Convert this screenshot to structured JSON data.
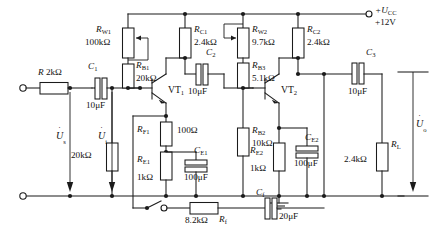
{
  "supply": {
    "label": "+U",
    "sub": "CC",
    "voltage": "+12V"
  },
  "sources": {
    "us_symbol": "U",
    "us_sub": "s",
    "ui_symbol": "U",
    "ui_sub": "i",
    "uo_symbol": "U",
    "uo_sub": "o"
  },
  "transistors": [
    {
      "name": "VT",
      "sub": "1",
      "type": "npn"
    },
    {
      "name": "VT",
      "sub": "2",
      "type": "npn"
    }
  ],
  "components": [
    {
      "id": "R",
      "ref": "R",
      "sub": "",
      "value": "2kΩ",
      "kind": "resistor"
    },
    {
      "id": "RW1",
      "ref": "R",
      "sub": "W1",
      "value": "100kΩ",
      "kind": "potentiometer"
    },
    {
      "id": "RB1",
      "ref": "R",
      "sub": "B1",
      "value": "20kΩ",
      "kind": "resistor"
    },
    {
      "id": "RC1",
      "ref": "R",
      "sub": "C1",
      "value": "2.4kΩ",
      "kind": "resistor"
    },
    {
      "id": "RW2",
      "ref": "R",
      "sub": "W2",
      "value": "9.7kΩ",
      "kind": "potentiometer"
    },
    {
      "id": "RB3",
      "ref": "R",
      "sub": "B3",
      "value": "5.1kΩ",
      "kind": "resistor"
    },
    {
      "id": "RC2",
      "ref": "R",
      "sub": "C2",
      "value": "2.4kΩ",
      "kind": "resistor"
    },
    {
      "id": "RF1",
      "ref": "R",
      "sub": "F1",
      "value": "100Ω",
      "kind": "resistor"
    },
    {
      "id": "RE1",
      "ref": "R",
      "sub": "E1",
      "value": "1kΩ",
      "kind": "resistor"
    },
    {
      "id": "RB2",
      "ref": "R",
      "sub": "B2",
      "value": "10kΩ",
      "kind": "resistor"
    },
    {
      "id": "RE2",
      "ref": "R",
      "sub": "E2",
      "value": "1kΩ",
      "kind": "resistor"
    },
    {
      "id": "RL",
      "ref": "R",
      "sub": "L",
      "value": "2.4kΩ",
      "kind": "resistor"
    },
    {
      "id": "Rf",
      "ref": "R",
      "sub": "f",
      "value": "8.2kΩ",
      "kind": "resistor"
    },
    {
      "id": "C1",
      "ref": "C",
      "sub": "1",
      "value": "10μF",
      "kind": "capacitor"
    },
    {
      "id": "C2",
      "ref": "C",
      "sub": "2",
      "value": "10μF",
      "kind": "capacitor"
    },
    {
      "id": "C3",
      "ref": "C",
      "sub": "3",
      "value": "10μF",
      "kind": "capacitor"
    },
    {
      "id": "CE1",
      "ref": "C",
      "sub": "E1",
      "value": "100μF",
      "kind": "capacitor"
    },
    {
      "id": "CE2",
      "ref": "C",
      "sub": "E2",
      "value": "100μF",
      "kind": "capacitor"
    },
    {
      "id": "Cf",
      "ref": "C",
      "sub": "f",
      "value": "20μF",
      "kind": "capacitor"
    }
  ],
  "labels": {
    "R_ref": "R",
    "R_val": "2kΩ",
    "RW1_ref": "R",
    "RW1_sub": "W1",
    "RW1_val": "100kΩ",
    "RB1_ref": "R",
    "RB1_sub": "B1",
    "RB1_val": "20kΩ",
    "RC1_ref": "R",
    "RC1_sub": "C1",
    "RC1_val": "2.4kΩ",
    "RW2_ref": "R",
    "RW2_sub": "W2",
    "RW2_val": "9.7kΩ",
    "RB3_ref": "R",
    "RB3_sub": "B3",
    "RB3_val": "5.1kΩ",
    "RC2_ref": "R",
    "RC2_sub": "C2",
    "RC2_val": "2.4kΩ",
    "RF1_ref": "R",
    "RF1_sub": "F1",
    "RF1_val": "100Ω",
    "RE1_ref": "R",
    "RE1_sub": "E1",
    "RE1_val": "1kΩ",
    "RB2_ref": "R",
    "RB2_sub": "B2",
    "RB2_val": "10kΩ",
    "RE2_ref": "R",
    "RE2_sub": "E2",
    "RE2_val": "1kΩ",
    "RL_ref": "R",
    "RL_sub": "L",
    "RL_val": "2.4kΩ",
    "Rf_ref": "R",
    "Rf_sub": "f",
    "Rf_val": "8.2kΩ",
    "C1_ref": "C",
    "C1_sub": "1",
    "C1_val": "10μF",
    "C2_ref": "C",
    "C2_sub": "2",
    "C2_val": "10μF",
    "C3_ref": "C",
    "C3_sub": "3",
    "C3_val": "10μF",
    "CE1_ref": "C",
    "CE1_sub": "E1",
    "CE1_val": "100μF",
    "CE2_ref": "C",
    "CE2_sub": "E2",
    "CE2_val": "100μF",
    "Cf_ref": "C",
    "Cf_sub": "f",
    "Cf_val": "20μF",
    "VT1_ref": "VT",
    "VT1_sub": "1",
    "VT2_ref": "VT",
    "VT2_sub": "2",
    "ucc_ref": "+U",
    "ucc_sub": "CC",
    "ucc_val": "+12V",
    "us_ref": "U",
    "us_sub": "s",
    "ui_ref": "U",
    "ui_sub": "i",
    "uo_ref": "U",
    "uo_sub": "o"
  },
  "colors": {
    "ink": "#1b1b1b",
    "background": "#ffffff"
  }
}
